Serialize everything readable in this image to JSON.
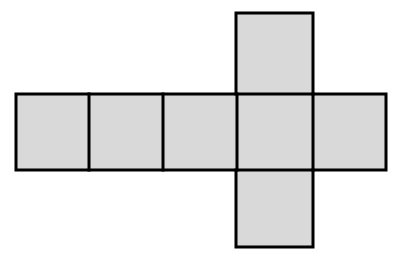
{
  "figure": {
    "canvas": {
      "width": 401,
      "height": 267
    },
    "background_color": "#ffffff",
    "face_fill_color": "#d9d9d9",
    "edge_stroke_color": "#000000",
    "edge_stroke_width": 3,
    "square_size": 74,
    "face_count": 6,
    "faces": [
      {
        "id": "face-left-1",
        "label": "left outer face",
        "x": 16,
        "y": 94,
        "w": 73,
        "h": 76,
        "row": "horizontal",
        "column_index": 1
      },
      {
        "id": "face-left-2",
        "label": "second face",
        "x": 89,
        "y": 94,
        "w": 74,
        "h": 76,
        "row": "horizontal",
        "column_index": 2
      },
      {
        "id": "face-left-3",
        "label": "third face",
        "x": 163,
        "y": 94,
        "w": 74,
        "h": 76,
        "row": "horizontal",
        "column_index": 3
      },
      {
        "id": "face-center",
        "label": "center face",
        "x": 237,
        "y": 94,
        "w": 76,
        "h": 76,
        "row": "horizontal",
        "column_index": 4
      },
      {
        "id": "face-right",
        "label": "right outer face",
        "x": 313,
        "y": 94,
        "w": 73,
        "h": 76,
        "row": "horizontal",
        "column_index": 5
      },
      {
        "id": "face-top",
        "label": "top face",
        "x": 236,
        "y": 13,
        "w": 77,
        "h": 81,
        "row": "vertical",
        "column_index": 4
      },
      {
        "id": "face-bottom",
        "label": "bottom face",
        "x": 236,
        "y": 170,
        "w": 77,
        "h": 77,
        "row": "vertical",
        "column_index": 4
      }
    ],
    "divider_lines": [
      {
        "id": "divider-1",
        "orientation": "vertical",
        "x": 89,
        "y1": 94,
        "y2": 170
      },
      {
        "id": "divider-2",
        "orientation": "vertical",
        "x": 163,
        "y1": 94,
        "y2": 170
      },
      {
        "id": "divider-3",
        "orientation": "vertical",
        "x": 237,
        "y1": 94,
        "y2": 170
      },
      {
        "id": "divider-4",
        "orientation": "vertical",
        "x": 313,
        "y1": 94,
        "y2": 170
      },
      {
        "id": "divider-5",
        "orientation": "horizontal",
        "y": 94,
        "x1": 236,
        "x2": 313
      },
      {
        "id": "divider-6",
        "orientation": "horizontal",
        "y": 170,
        "x1": 236,
        "x2": 313
      }
    ],
    "outline_path": "M 16 94 L 236 94 L 236 13 L 313 13 L 313 94 L 386 94 L 386 170 L 313 170 L 313 247 L 236 247 L 236 170 L 16 170 Z"
  }
}
